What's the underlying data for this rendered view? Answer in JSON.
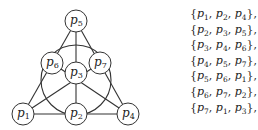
{
  "diagram": {
    "nodes": [
      {
        "id": "p1",
        "label": "p",
        "sub": "1",
        "x": 23,
        "y": 114
      },
      {
        "id": "p2",
        "label": "p",
        "sub": "2",
        "x": 76,
        "y": 114
      },
      {
        "id": "p3",
        "label": "p",
        "sub": "3",
        "x": 76,
        "y": 73
      },
      {
        "id": "p4",
        "label": "p",
        "sub": "4",
        "x": 128,
        "y": 114
      },
      {
        "id": "p5",
        "label": "p",
        "sub": "5",
        "x": 76,
        "y": 21
      },
      {
        "id": "p6",
        "label": "p",
        "sub": "6",
        "x": 52,
        "y": 63
      },
      {
        "id": "p7",
        "label": "p",
        "sub": "7",
        "x": 100,
        "y": 63
      }
    ],
    "lines": [
      {
        "type": "segment",
        "points": [
          "p1",
          "p2",
          "p4"
        ]
      },
      {
        "type": "segment",
        "points": [
          "p5",
          "p6",
          "p1"
        ]
      },
      {
        "type": "segment",
        "points": [
          "p5",
          "p7",
          "p4"
        ]
      },
      {
        "type": "segment",
        "points": [
          "p5",
          "p3",
          "p2"
        ]
      },
      {
        "type": "segment",
        "points": [
          "p6",
          "p3",
          "p4"
        ]
      },
      {
        "type": "segment",
        "points": [
          "p7",
          "p3",
          "p1"
        ]
      },
      {
        "type": "circle",
        "points": [
          "p6",
          "p7",
          "p2"
        ]
      }
    ],
    "node_radius": 11,
    "circle": {
      "cx": 76,
      "cy": 80,
      "r": 35
    }
  },
  "sets": [
    {
      "items": [
        {
          "p": "p",
          "s": "1"
        },
        {
          "p": "p",
          "s": "2"
        },
        {
          "p": "p",
          "s": "4"
        }
      ]
    },
    {
      "items": [
        {
          "p": "p",
          "s": "2"
        },
        {
          "p": "p",
          "s": "3"
        },
        {
          "p": "p",
          "s": "5"
        }
      ]
    },
    {
      "items": [
        {
          "p": "p",
          "s": "3"
        },
        {
          "p": "p",
          "s": "4"
        },
        {
          "p": "p",
          "s": "6"
        }
      ]
    },
    {
      "items": [
        {
          "p": "p",
          "s": "4"
        },
        {
          "p": "p",
          "s": "5"
        },
        {
          "p": "p",
          "s": "7"
        }
      ]
    },
    {
      "items": [
        {
          "p": "p",
          "s": "5"
        },
        {
          "p": "p",
          "s": "6"
        },
        {
          "p": "p",
          "s": "1"
        }
      ]
    },
    {
      "items": [
        {
          "p": "p",
          "s": "6"
        },
        {
          "p": "p",
          "s": "7"
        },
        {
          "p": "p",
          "s": "2"
        }
      ]
    },
    {
      "items": [
        {
          "p": "p",
          "s": "7"
        },
        {
          "p": "p",
          "s": "1"
        },
        {
          "p": "p",
          "s": "3"
        }
      ]
    }
  ],
  "set_texts": [
    "{p1, p2, p4},",
    "{p2, p3, p5},",
    "{p3, p4, p6},",
    "{p4, p5, p7},",
    "{p5, p6, p1},",
    "{p6, p7, p2},",
    "{p7, p1, p3},"
  ]
}
